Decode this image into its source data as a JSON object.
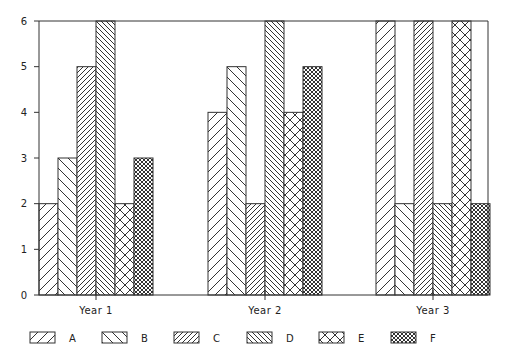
{
  "chart_data": {
    "type": "bar",
    "title": "",
    "xlabel": "",
    "ylabel": "",
    "categories": [
      "Year 1",
      "Year 2",
      "Year 3"
    ],
    "series": [
      {
        "name": "A",
        "values": [
          2,
          4,
          6
        ],
        "pattern": "diag-wide-up"
      },
      {
        "name": "B",
        "values": [
          3,
          5,
          2
        ],
        "pattern": "diag-wide-down"
      },
      {
        "name": "C",
        "values": [
          5,
          2,
          6
        ],
        "pattern": "diag-dense-up"
      },
      {
        "name": "D",
        "values": [
          6,
          6,
          2
        ],
        "pattern": "diag-dense-down"
      },
      {
        "name": "E",
        "values": [
          2,
          4,
          6
        ],
        "pattern": "crosshatch-wide"
      },
      {
        "name": "F",
        "values": [
          3,
          5,
          2
        ],
        "pattern": "crosshatch-dense"
      }
    ],
    "ylim": [
      0,
      6
    ],
    "yticks": [
      0,
      1,
      2,
      3,
      4,
      5,
      6
    ],
    "grid": false,
    "legend_position": "bottom",
    "bar_fill": "#ffffff",
    "line_color": "#333333"
  },
  "layout": {
    "plot_left": 39,
    "plot_right": 488,
    "plot_top": 21,
    "plot_bottom": 295,
    "group_starts": [
      39,
      208,
      376
    ],
    "bar_width": 19
  },
  "legend": {
    "items": [
      {
        "label": "A",
        "x": 30
      },
      {
        "label": "B",
        "x": 102
      },
      {
        "label": "C",
        "x": 174
      },
      {
        "label": "D",
        "x": 247
      },
      {
        "label": "E",
        "x": 319
      },
      {
        "label": "F",
        "x": 391
      }
    ]
  }
}
